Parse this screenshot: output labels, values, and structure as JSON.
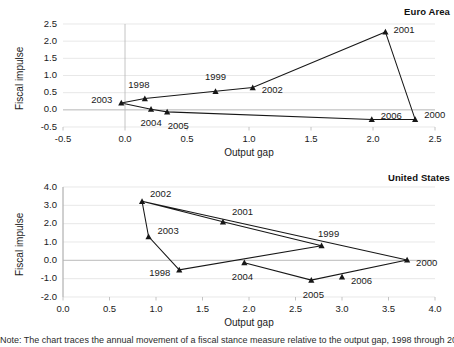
{
  "figure": {
    "footnote": "Note: The chart traces the annual movement of a fiscal stance measure relative to the output gap, 1998 through 2006."
  },
  "chart_data": [
    {
      "type": "line",
      "title": "Euro Area",
      "xlabel": "Output gap",
      "ylabel": "Fiscal impulse",
      "xlim": [
        -0.5,
        2.5
      ],
      "ylim": [
        -0.5,
        2.5
      ],
      "xticks": [
        "-0.5",
        "0.0",
        "0.5",
        "1.0",
        "1.5",
        "2.0",
        "2.5"
      ],
      "xtick_values": [
        -0.5,
        0.0,
        0.5,
        1.0,
        1.5,
        2.0,
        2.5
      ],
      "yticks": [
        "-0.5",
        "0.0",
        "0.5",
        "1.0",
        "1.5",
        "2.0",
        "2.5"
      ],
      "ytick_values": [
        -0.5,
        0.0,
        0.5,
        1.0,
        1.5,
        2.0,
        2.5
      ],
      "grid": "horizontal",
      "legend": "none",
      "marker": "triangle",
      "points": [
        {
          "label": "1998",
          "x": 0.16,
          "y": 0.33,
          "label_dx": -6,
          "label_dy": -14,
          "anchor": "middle"
        },
        {
          "label": "1999",
          "x": 0.73,
          "y": 0.54,
          "label_dx": 0,
          "label_dy": -14,
          "anchor": "middle"
        },
        {
          "label": "2000",
          "x": 2.34,
          "y": -0.28,
          "label_dx": 9,
          "label_dy": -4,
          "anchor": "start"
        },
        {
          "label": "2001",
          "x": 2.1,
          "y": 2.27,
          "label_dx": 8,
          "label_dy": -2,
          "anchor": "start"
        },
        {
          "label": "2002",
          "x": 1.03,
          "y": 0.65,
          "label_dx": 9,
          "label_dy": 2,
          "anchor": "start"
        },
        {
          "label": "2003",
          "x": -0.03,
          "y": 0.2,
          "label_dx": -9,
          "label_dy": -3,
          "anchor": "end"
        },
        {
          "label": "2004",
          "x": 0.21,
          "y": 0.02,
          "label_dx": 0,
          "label_dy": 14,
          "anchor": "middle"
        },
        {
          "label": "2005",
          "x": 0.34,
          "y": -0.06,
          "label_dx": 11,
          "label_dy": 14,
          "anchor": "middle"
        },
        {
          "label": "2006",
          "x": 1.99,
          "y": -0.28,
          "label_dx": 9,
          "label_dy": -3,
          "anchor": "start"
        }
      ],
      "path_order": [
        "2003",
        "1998",
        "1999",
        "2002",
        "2001",
        "2000",
        "2006",
        "2005",
        "2004",
        "2003"
      ]
    },
    {
      "type": "line",
      "title": "United States",
      "xlabel": "Output gap",
      "ylabel": "Fiscal impulse",
      "xlim": [
        0.0,
        4.0
      ],
      "ylim": [
        -2.0,
        4.0
      ],
      "xticks": [
        "0.0",
        "0.5",
        "1.0",
        "1.5",
        "2.0",
        "2.5",
        "3.0",
        "3.5",
        "4.0"
      ],
      "xtick_values": [
        0.0,
        0.5,
        1.0,
        1.5,
        2.0,
        2.5,
        3.0,
        3.5,
        4.0
      ],
      "yticks": [
        "-2.0",
        "-1.0",
        "0.0",
        "1.0",
        "2.0",
        "3.0",
        "4.0"
      ],
      "ytick_values": [
        -2.0,
        -1.0,
        0.0,
        1.0,
        2.0,
        3.0,
        4.0
      ],
      "grid": "horizontal",
      "legend": "none",
      "marker": "triangle",
      "points": [
        {
          "label": "1998",
          "x": 1.25,
          "y": -0.52,
          "label_dx": -9,
          "label_dy": 3,
          "anchor": "end"
        },
        {
          "label": "1999",
          "x": 2.78,
          "y": 0.8,
          "label_dx": 7,
          "label_dy": -12,
          "anchor": "middle"
        },
        {
          "label": "2000",
          "x": 3.7,
          "y": 0.02,
          "label_dx": 9,
          "label_dy": 3,
          "anchor": "start"
        },
        {
          "label": "2001",
          "x": 1.72,
          "y": 2.1,
          "label_dx": 9,
          "label_dy": -10,
          "anchor": "start"
        },
        {
          "label": "2002",
          "x": 0.85,
          "y": 3.22,
          "label_dx": 8,
          "label_dy": -7,
          "anchor": "start"
        },
        {
          "label": "2003",
          "x": 0.92,
          "y": 1.3,
          "label_dx": 9,
          "label_dy": -6,
          "anchor": "start"
        },
        {
          "label": "2004",
          "x": 1.95,
          "y": -0.13,
          "label_dx": -2,
          "label_dy": 14,
          "anchor": "middle"
        },
        {
          "label": "2005",
          "x": 2.67,
          "y": -1.08,
          "label_dx": 2,
          "label_dy": 15,
          "anchor": "middle"
        },
        {
          "label": "2006",
          "x": 3.0,
          "y": -0.9,
          "label_dx": 9,
          "label_dy": 4,
          "anchor": "start"
        }
      ],
      "path_order": [
        "2002",
        "2003",
        "1998",
        "1999",
        "2001",
        "2002",
        "2000",
        "2005",
        "2004"
      ]
    }
  ]
}
